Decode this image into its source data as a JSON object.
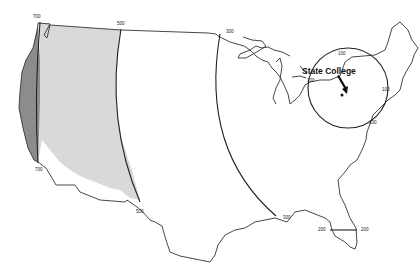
{
  "map": {
    "title": "",
    "subject": "Distance zones from State College",
    "center_label": "State College",
    "distance_arcs": [
      {
        "value": "100",
        "labels": [
          "100",
          "100",
          "100",
          "100"
        ]
      },
      {
        "value": "300",
        "labels": [
          "300",
          "300"
        ]
      },
      {
        "value": "500",
        "labels": [
          "500",
          "500"
        ]
      },
      {
        "value": "700",
        "labels": [
          "700",
          "700"
        ]
      }
    ],
    "florida_labels": [
      "200",
      "200"
    ],
    "zones": [
      {
        "name": "between-500-and-700",
        "color": "#d9d9d9"
      },
      {
        "name": "beyond-700",
        "color": "#8c8c8c"
      }
    ],
    "colors": {
      "land": "#ffffff",
      "outline": "#333333",
      "arc": "#222222"
    }
  }
}
